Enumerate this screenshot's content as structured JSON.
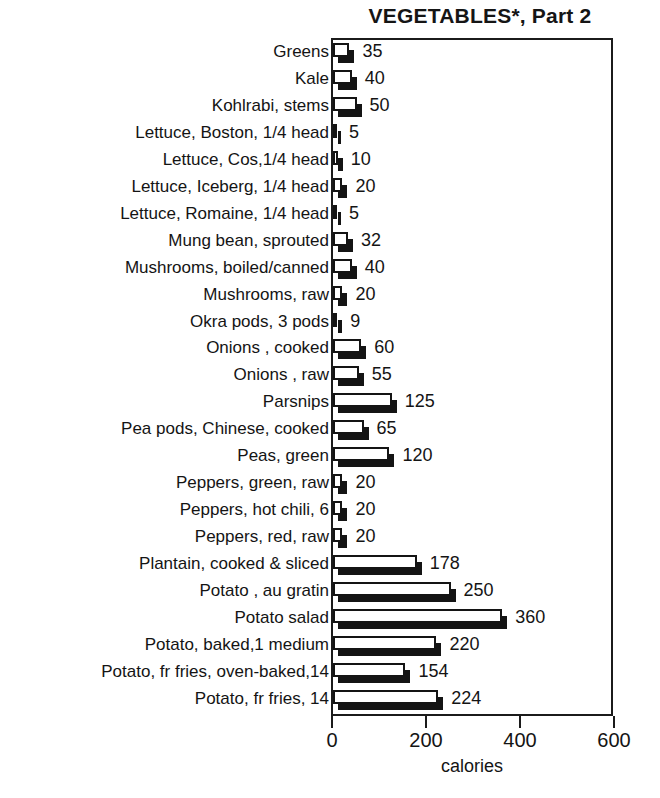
{
  "chart_data": {
    "type": "bar",
    "orientation": "horizontal",
    "title": "VEGETABLES*, Part 2",
    "xlabel": "calories",
    "ylabel": "",
    "xlim": [
      0,
      600
    ],
    "xticks": [
      0,
      200,
      400,
      600
    ],
    "grid": false,
    "legend": null,
    "value_labels_shown": true,
    "bar_style": "3d-shadow-white-face",
    "categories": [
      "Greens",
      "Kale",
      "Kohlrabi, stems",
      "Lettuce, Boston, 1/4 head",
      "Lettuce, Cos,1/4 head",
      "Lettuce, Iceberg, 1/4 head",
      "Lettuce, Romaine, 1/4 head",
      "Mung bean, sprouted",
      "Mushrooms, boiled/canned",
      "Mushrooms, raw",
      "Okra pods, 3 pods",
      "Onions , cooked",
      "Onions , raw",
      "Parsnips",
      "Pea pods, Chinese, cooked",
      "Peas, green",
      "Peppers, green, raw",
      "Peppers, hot chili, 6",
      "Peppers, red, raw",
      "Plantain, cooked & sliced",
      "Potato , au gratin",
      "Potato salad",
      "Potato, baked,1 medium",
      "Potato, fr fries, oven-baked,14",
      "Potato, fr fries, 14"
    ],
    "values": [
      35,
      40,
      50,
      5,
      10,
      20,
      5,
      32,
      40,
      20,
      9,
      60,
      55,
      125,
      65,
      120,
      20,
      20,
      20,
      178,
      250,
      360,
      220,
      154,
      224
    ],
    "series": [
      {
        "name": "calories",
        "values": [
          35,
          40,
          50,
          5,
          10,
          20,
          5,
          32,
          40,
          20,
          9,
          60,
          55,
          125,
          65,
          120,
          20,
          20,
          20,
          178,
          250,
          360,
          220,
          154,
          224
        ]
      }
    ]
  },
  "colors": {
    "bar_face": "#ffffff",
    "bar_shadow": "#141414",
    "axis": "#1b1b1b",
    "text": "#141414",
    "background": "#ffffff"
  }
}
